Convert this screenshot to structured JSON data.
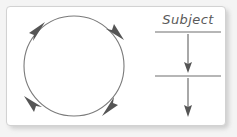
{
  "panel": {
    "background_color": "#ffffff",
    "border_color": "#d2d2d2",
    "page_background_color": "#f4f4f4"
  },
  "colors": {
    "stroke": "#7a7a7a",
    "arrowhead": "#555555",
    "rule": "#6e6e6e",
    "text": "#5a5a5a"
  },
  "cycle_diagram": {
    "name": "circular-cycle",
    "direction": "clockwise",
    "center_x": 74,
    "center_y": 66,
    "radius": 50,
    "arrowhead_count": 4,
    "arrowhead_angles_deg": [
      215,
      305,
      35,
      125
    ]
  },
  "subject_column": {
    "heading": "Subject",
    "rules": [
      {
        "name": "top-rule",
        "y": 32
      },
      {
        "name": "middle-rule",
        "y": 76
      }
    ],
    "arrows": [
      {
        "name": "subject-arrow-upper",
        "from_y": 34,
        "to_y": 72
      },
      {
        "name": "subject-arrow-lower",
        "from_y": 78,
        "to_y": 116
      }
    ]
  }
}
